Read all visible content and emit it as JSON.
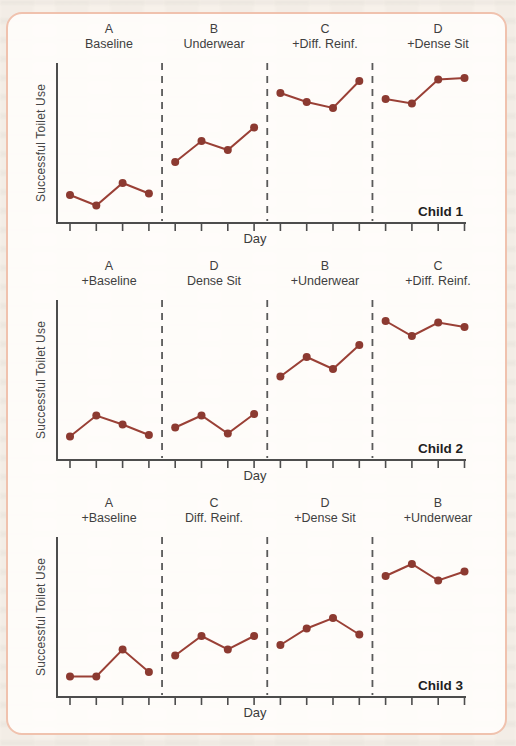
{
  "figure": {
    "type": "multielement-design-line-charts",
    "panels_count": 3
  },
  "colors": {
    "series_line": "#9a4036",
    "series_marker": "#8c3a31",
    "axis": "#4d4d4d",
    "tick": "#4d4d4d",
    "divider": "#5a5a5a",
    "card_border": "#f0c2ae",
    "card_background": "#fffdfb",
    "page_background": "#f7f1ea"
  },
  "chart_data": [
    {
      "type": "line",
      "child": "Child 1",
      "xlabel": "Day",
      "ylabel": "Successful Toilet Use",
      "ylim": [
        0,
        10
      ],
      "y_tick_labels": "none",
      "x_ticks": 16,
      "days_per_phase": 4,
      "phase_dividers": "vertical dashed lines between phases",
      "grid": false,
      "legend": "none",
      "phases": [
        {
          "letter": "A",
          "name": "Baseline",
          "values": [
            1.4,
            0.7,
            2.2,
            1.5
          ]
        },
        {
          "letter": "B",
          "name": "Underwear",
          "values": [
            3.6,
            5.0,
            4.4,
            5.9
          ]
        },
        {
          "letter": "C",
          "name": "+Diff. Reinf.",
          "values": [
            8.2,
            7.6,
            7.2,
            9.0
          ]
        },
        {
          "letter": "D",
          "name": "+Dense Sit",
          "values": [
            7.8,
            7.5,
            9.1,
            9.2
          ]
        }
      ]
    },
    {
      "type": "line",
      "child": "Child 2",
      "xlabel": "Day",
      "ylabel": "Successful Toilet Use",
      "ylim": [
        0,
        10
      ],
      "y_tick_labels": "none",
      "x_ticks": 16,
      "days_per_phase": 4,
      "phase_dividers": "vertical dashed lines between phases",
      "grid": false,
      "legend": "none",
      "phases": [
        {
          "letter": "A",
          "name": "+Baseline",
          "values": [
            1.1,
            2.5,
            1.9,
            1.2
          ]
        },
        {
          "letter": "D",
          "name": "Dense Sit",
          "values": [
            1.7,
            2.5,
            1.3,
            2.6
          ]
        },
        {
          "letter": "B",
          "name": "+Underwear",
          "values": [
            5.1,
            6.4,
            5.6,
            7.2
          ]
        },
        {
          "letter": "C",
          "name": "+Diff. Reinf.",
          "values": [
            8.8,
            7.8,
            8.7,
            8.4
          ]
        }
      ]
    },
    {
      "type": "line",
      "child": "Child 3",
      "xlabel": "Day",
      "ylabel": "Successful Toilet Use",
      "ylim": [
        0,
        10
      ],
      "y_tick_labels": "none",
      "x_ticks": 16,
      "days_per_phase": 4,
      "phase_dividers": "vertical dashed lines between phases",
      "grid": false,
      "legend": "none",
      "phases": [
        {
          "letter": "A",
          "name": "+Baseline",
          "values": [
            0.9,
            0.9,
            2.7,
            1.2
          ]
        },
        {
          "letter": "C",
          "name": "Diff. Reinf.",
          "values": [
            2.3,
            3.6,
            2.7,
            3.6
          ]
        },
        {
          "letter": "D",
          "name": "+Dense Sit",
          "values": [
            3.0,
            4.1,
            4.8,
            3.7
          ]
        },
        {
          "letter": "B",
          "name": "+Underwear",
          "values": [
            7.6,
            8.4,
            7.3,
            7.9
          ]
        }
      ]
    }
  ]
}
